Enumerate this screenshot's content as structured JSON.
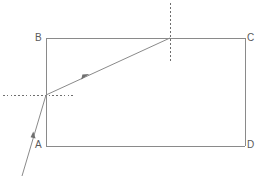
{
  "figure": {
    "type": "optics-ray-diagram",
    "background_color": "#ffffff",
    "stroke_color": "#8a8a8a",
    "label_color": "#5a5a5a",
    "dotted_color": "#6e6e6e",
    "canvas": {
      "width": 259,
      "height": 180
    }
  },
  "block": {
    "name": "rectangular-block",
    "vertices": {
      "A": {
        "label": "A",
        "x": 46,
        "y": 146
      },
      "B": {
        "label": "B",
        "x": 46,
        "y": 38
      },
      "C": {
        "label": "C",
        "x": 245,
        "y": 38
      },
      "D": {
        "label": "D",
        "x": 245,
        "y": 146
      }
    },
    "edges": [
      {
        "name": "edge-AB",
        "from": "A",
        "to": "B"
      },
      {
        "name": "edge-BC",
        "from": "B",
        "to": "C"
      },
      {
        "name": "edge-CD",
        "from": "C",
        "to": "D"
      },
      {
        "name": "edge-DA",
        "from": "D",
        "to": "A"
      }
    ]
  },
  "rays": {
    "incident": {
      "name": "incident-ray",
      "from": {
        "x": 22,
        "y": 176
      },
      "to": {
        "x": 46,
        "y": 95
      },
      "arrow_at": {
        "x": 33,
        "y": 136
      }
    },
    "refracted": {
      "name": "refracted-ray",
      "from": {
        "x": 46,
        "y": 95
      },
      "to": {
        "x": 170,
        "y": 38
      },
      "arrow_at": {
        "x": 85,
        "y": 77
      }
    }
  },
  "normals": {
    "entry": {
      "name": "normal-at-entry-point",
      "orientation": "horizontal",
      "x1": 3,
      "x2": 73,
      "y": 95
    },
    "exit": {
      "name": "normal-at-top-surface",
      "orientation": "vertical",
      "x": 170,
      "y1": 3,
      "y2": 63
    }
  },
  "points": {
    "entry_point": {
      "name": "entry-point",
      "x": 46,
      "y": 95
    },
    "top_hit_point": {
      "name": "top-surface-hit-point",
      "x": 170,
      "y": 38
    }
  }
}
